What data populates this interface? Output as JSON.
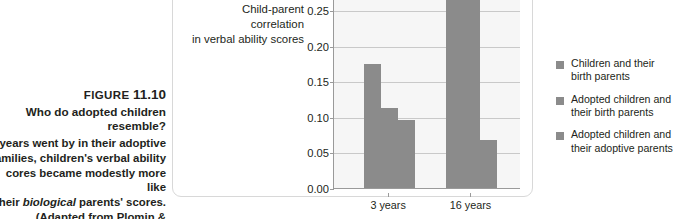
{
  "caption": {
    "figure_label": "FIGURE",
    "figure_number": "11.10",
    "title_line1": "Who do adopted children",
    "title_line2": "resemble?",
    "body_line1": "e years went by in their adoptive",
    "body_line2": "families, children's verbal ability",
    "body_line3": "cores became modestly more like",
    "body_line4_pre": "their ",
    "body_line4_em": "biological",
    "body_line4_post": " parents' scores.",
    "body_line5": "(Adapted from Plomin &",
    "body_line6": "DeFries, 1998.)"
  },
  "y_axis_title": {
    "line1": "Child-parent correlation",
    "line2": "in verbal ability scores"
  },
  "legend": {
    "items": [
      {
        "line1": "Children and their",
        "line2": "birth parents",
        "color": "#8b8b8b"
      },
      {
        "line1": "Adopted children and",
        "line2": "their birth parents",
        "color": "#8b8b8b"
      },
      {
        "line1": "Adopted children and",
        "line2": "their adoptive parents",
        "color": "#8b8b8b"
      }
    ]
  },
  "chart_data": {
    "type": "bar",
    "title": "Who do adopted children resemble?",
    "xlabel": "",
    "ylabel": "Child-parent correlation in verbal ability scores",
    "categories": [
      "3 years",
      "16 years"
    ],
    "ylim": [
      0.0,
      0.35
    ],
    "ytick_labels": [
      "0.00",
      "0.05",
      "0.10",
      "0.15",
      "0.20",
      "0.25",
      "0.30"
    ],
    "ytick_values": [
      0.0,
      0.05,
      0.1,
      0.15,
      0.2,
      0.25,
      0.3
    ],
    "grid": true,
    "legend_position": "right",
    "note": "At 16 years the first two bars extend above the visible top edge of the cropped screenshot.",
    "series": [
      {
        "name": "Children and their birth parents",
        "color": "#8b8b8b",
        "values": [
          0.175,
          0.36
        ]
      },
      {
        "name": "Adopted children and their birth parents",
        "color": "#8b8b8b",
        "values": [
          0.112,
          0.36
        ]
      },
      {
        "name": "Adopted children and their adoptive parents",
        "color": "#8b8b8b",
        "values": [
          0.096,
          0.067
        ]
      }
    ]
  }
}
